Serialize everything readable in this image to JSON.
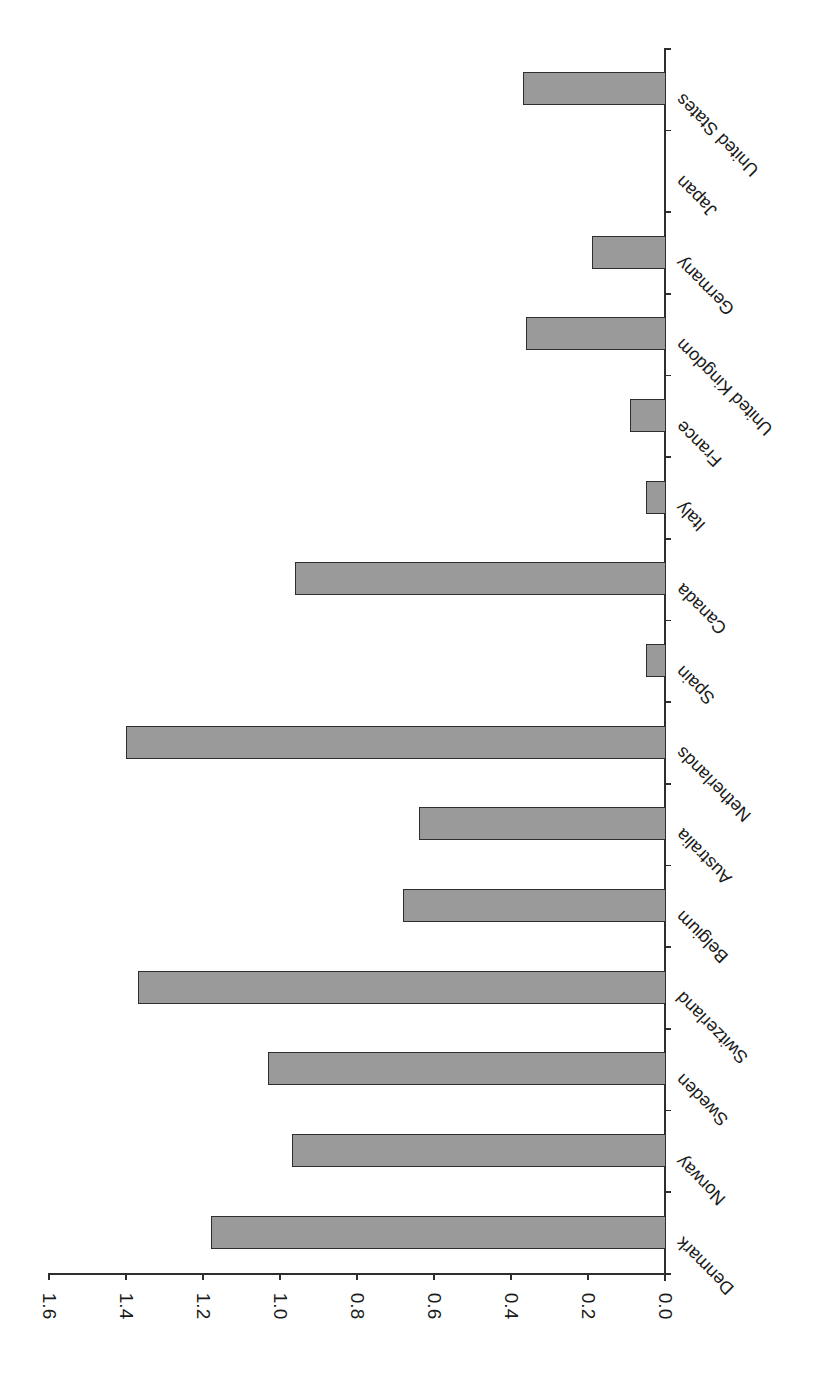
{
  "chart_data": {
    "type": "bar",
    "orientation": "rotated-90",
    "title": "",
    "xlabel": "",
    "ylabel": "",
    "categories": [
      "United States",
      "Japan",
      "Germany",
      "United Kingdom",
      "France",
      "Italy",
      "Canada",
      "Spain",
      "Netherlands",
      "Australia",
      "Belgium",
      "Switzerland",
      "Sweden",
      "Norway",
      "Denmark"
    ],
    "values": [
      0.37,
      0,
      0.19,
      0.36,
      0.09,
      0.05,
      0.96,
      0.05,
      1.4,
      0.64,
      0.68,
      1.37,
      1.03,
      0.97,
      1.18
    ],
    "ylim": [
      0,
      1.6
    ],
    "y_ticks": [
      "0.0",
      "0.2",
      "0.4",
      "0.6",
      "0.8",
      "1.0",
      "1.2",
      "1.4",
      "1.6"
    ],
    "grid": false,
    "legend": null,
    "bar_color": "#9a9a9a",
    "bar_border_color": "#2e2e2e"
  }
}
